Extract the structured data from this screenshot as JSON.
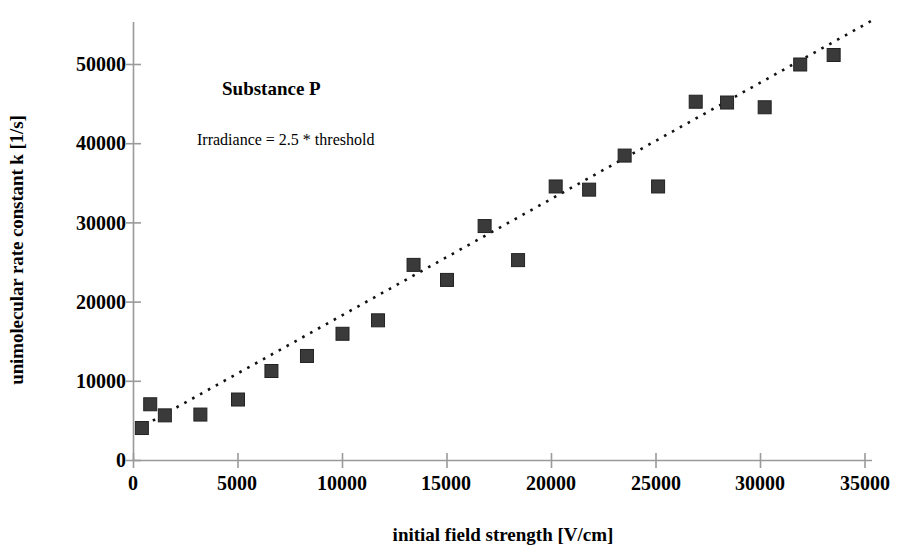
{
  "chart_data": {
    "type": "scatter",
    "title": "",
    "annotations": [
      {
        "name": "substance-label",
        "text": "Substance P",
        "bold": true
      },
      {
        "name": "irradiance-label",
        "text": "Irradiance = 2.5 * threshold",
        "bold": false
      }
    ],
    "xlabel": "initial field strength [V/cm]",
    "ylabel": "unimolecular rate constant k [1/s]",
    "xlim": [
      0,
      35000
    ],
    "ylim": [
      0,
      55000
    ],
    "xticks": [
      0,
      5000,
      10000,
      15000,
      20000,
      25000,
      30000,
      35000
    ],
    "xtick_labels": [
      "0",
      "5000",
      "10000",
      "15000",
      "20000",
      "25000",
      "30000",
      "35000"
    ],
    "yticks": [
      0,
      10000,
      20000,
      30000,
      40000,
      50000
    ],
    "ytick_labels": [
      "0",
      "10000",
      "20000",
      "30000",
      "40000",
      "50000"
    ],
    "grid": false,
    "legend": null,
    "marker": {
      "shape": "square",
      "color": "#333333",
      "size_px": 13
    },
    "series": [
      {
        "name": "Substance P",
        "x": [
          400,
          800,
          1500,
          3200,
          5000,
          6600,
          8300,
          10000,
          11700,
          13400,
          15000,
          16800,
          18400,
          20200,
          21800,
          23500,
          25100,
          26900,
          28400,
          30200,
          31900,
          33500
        ],
        "y": [
          4100,
          7100,
          5700,
          5800,
          7700,
          11300,
          13200,
          16000,
          17700,
          24700,
          22800,
          29600,
          25300,
          34600,
          34200,
          38500,
          34600,
          45300,
          45200,
          44600,
          50000,
          51200
        ]
      }
    ],
    "trendline": {
      "type": "linear-dotted",
      "x_start": 600,
      "y_start": 4400,
      "x_end": 35400,
      "y_end": 55300,
      "style": "dotted",
      "color": "#000000"
    },
    "axis_color": "#808080"
  }
}
